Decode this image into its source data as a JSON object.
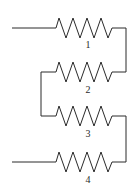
{
  "diagram": {
    "type": "circuit",
    "stroke_color": "#2a2a2a",
    "background": "#ffffff",
    "resistors": [
      {
        "id": 1,
        "label": "1",
        "y": 28
      },
      {
        "id": 2,
        "label": "2",
        "y": 72
      },
      {
        "id": 3,
        "label": "3",
        "y": 116
      },
      {
        "id": 4,
        "label": "4",
        "y": 162
      }
    ],
    "terminals": [
      {
        "name": "input",
        "at_resistor": 1,
        "side": "left"
      },
      {
        "name": "output",
        "at_resistor": 4,
        "side": "left"
      }
    ]
  }
}
